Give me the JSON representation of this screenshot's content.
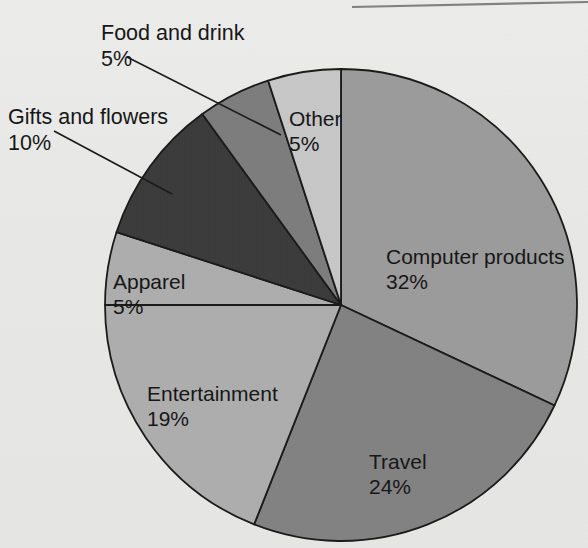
{
  "chart_data": {
    "type": "pie",
    "title": "",
    "subtitle": "",
    "xlabel": "",
    "ylabel": "",
    "legend_position": "none",
    "grid": false,
    "units": "percent",
    "total": 100,
    "start_angle_deg": 0,
    "direction": "clockwise",
    "categories": [
      "Computer products",
      "Travel",
      "Entertainment",
      "Apparel",
      "Gifts and flowers",
      "Food and drink",
      "Other"
    ],
    "values": [
      32,
      24,
      19,
      5,
      10,
      5,
      5
    ],
    "slices": [
      {
        "label": "Computer products",
        "value": 32,
        "value_text": "32%",
        "color": "#9b9b9b",
        "label_placement": "inside",
        "label_x": 386,
        "label_y": 248,
        "pct_x": 386,
        "pct_y": 273
      },
      {
        "label": "Travel",
        "value": 24,
        "value_text": "24%",
        "color": "#828282",
        "label_placement": "inside",
        "label_x": 369,
        "label_y": 453,
        "pct_x": 369,
        "pct_y": 478
      },
      {
        "label": "Entertainment",
        "value": 19,
        "value_text": "19%",
        "color": "#adadad",
        "label_placement": "inside",
        "label_x": 147,
        "label_y": 385,
        "pct_x": 147,
        "pct_y": 410
      },
      {
        "label": "Apparel",
        "value": 5,
        "value_text": "5%",
        "color": "#adadad",
        "label_placement": "inside",
        "label_x": 113,
        "label_y": 273,
        "pct_x": 113,
        "pct_y": 298
      },
      {
        "label": "Gifts and flowers",
        "value": 10,
        "value_text": "10%",
        "color": "#3b3b3b",
        "label_placement": "outside-left",
        "label_x": 8,
        "label_y": 108,
        "pct_x": 8,
        "pct_y": 134
      },
      {
        "label": "Food and drink",
        "value": 5,
        "value_text": "5%",
        "color": "#7d7d7d",
        "label_placement": "outside-top",
        "label_x": 101,
        "label_y": 24,
        "pct_x": 101,
        "pct_y": 50
      },
      {
        "label": "Other",
        "value": 5,
        "value_text": "5%",
        "color": "#c7c7c7",
        "label_placement": "inside",
        "label_x": 289,
        "label_y": 110,
        "pct_x": 289,
        "pct_y": 135
      }
    ],
    "geometry": {
      "center_x": 341,
      "center_y": 305,
      "radius": 236
    },
    "leader_lines": [
      {
        "name": "food-and-drink-leader",
        "x1": 127,
        "y1": 57,
        "x2": 281,
        "y2": 135
      },
      {
        "name": "gifts-and-flowers-leader",
        "x1": 54,
        "y1": 131,
        "x2": 172,
        "y2": 194
      }
    ]
  },
  "page": {
    "background_color": "#e8e8e6",
    "outline_color": "#1a1a1a"
  }
}
